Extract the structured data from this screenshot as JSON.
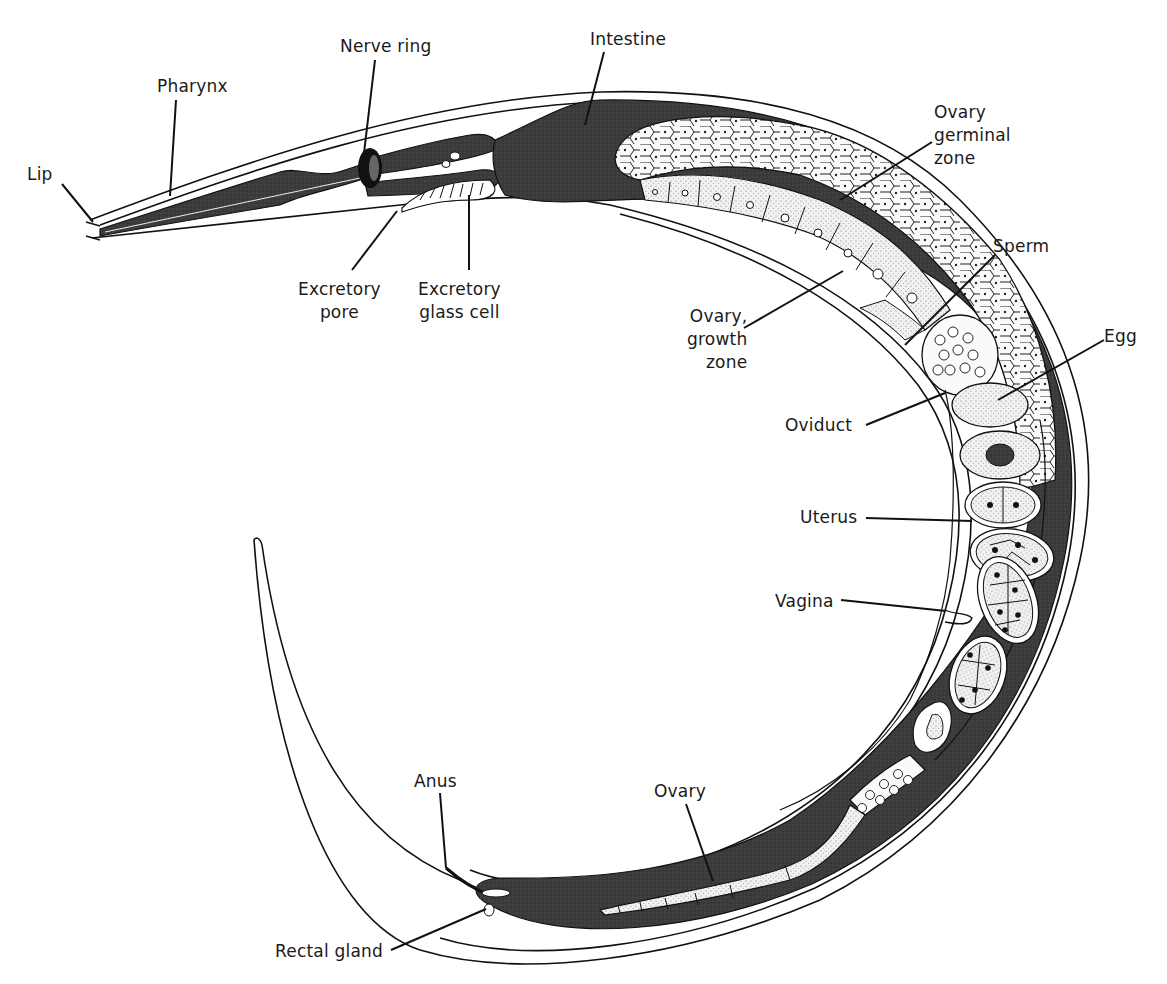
{
  "diagram": {
    "colors": {
      "background": "#ffffff",
      "outline": "#111111",
      "dark_tissue": "#3a3a3a",
      "cell_fill": "#f4f4f4",
      "stipple_fill": "#e6e6e6"
    },
    "labels": [
      {
        "id": "lip",
        "text": "Lip",
        "x": 27,
        "y": 163,
        "align": "left",
        "line": [
          [
            62,
            184
          ],
          [
            93,
            222
          ]
        ]
      },
      {
        "id": "pharynx",
        "text": "Pharynx",
        "x": 157,
        "y": 75,
        "align": "left",
        "line": [
          [
            176,
            100
          ],
          [
            170,
            196
          ]
        ]
      },
      {
        "id": "nerve-ring",
        "text": "Nerve ring",
        "x": 340,
        "y": 35,
        "align": "left",
        "line": [
          [
            375,
            60
          ],
          [
            362,
            170
          ]
        ]
      },
      {
        "id": "intestine",
        "text": "Intestine",
        "x": 590,
        "y": 28,
        "align": "left",
        "line": [
          [
            604,
            52
          ],
          [
            585,
            125
          ]
        ]
      },
      {
        "id": "excretory-pore",
        "text": "Excretory\npore",
        "x": 298,
        "y": 278,
        "align": "center",
        "line": [
          [
            352,
            270
          ],
          [
            397,
            211
          ]
        ]
      },
      {
        "id": "excretory-gland-cell",
        "text": "Excretory\nglass cell",
        "x": 418,
        "y": 278,
        "align": "center",
        "line": [
          [
            469,
            270
          ],
          [
            469,
            195
          ]
        ]
      },
      {
        "id": "ovary-germinal-zone",
        "text": "Ovary\ngerminal\nzone",
        "x": 934,
        "y": 101,
        "align": "left",
        "line": [
          [
            932,
            142
          ],
          [
            840,
            200
          ]
        ]
      },
      {
        "id": "ovary-growth-zone",
        "text": "Ovary,\ngrowth\nzone",
        "x": 687,
        "y": 305,
        "align": "right",
        "line": [
          [
            744,
            328
          ],
          [
            843,
            271
          ]
        ]
      },
      {
        "id": "sperm",
        "text": "Sperm",
        "x": 993,
        "y": 235,
        "align": "left",
        "line": [
          [
            995,
            255
          ],
          [
            905,
            345
          ]
        ]
      },
      {
        "id": "egg",
        "text": "Egg",
        "x": 1104,
        "y": 325,
        "align": "left",
        "line": [
          [
            1104,
            340
          ],
          [
            998,
            400
          ]
        ]
      },
      {
        "id": "oviduct",
        "text": "Oviduct",
        "x": 785,
        "y": 414,
        "align": "left",
        "line": [
          [
            866,
            425
          ],
          [
            945,
            393
          ]
        ]
      },
      {
        "id": "uterus",
        "text": "Uterus",
        "x": 800,
        "y": 506,
        "align": "left",
        "line": [
          [
            866,
            518
          ],
          [
            972,
            521
          ]
        ]
      },
      {
        "id": "vagina",
        "text": "Vagina",
        "x": 775,
        "y": 590,
        "align": "left",
        "line": [
          [
            841,
            600
          ],
          [
            946,
            611
          ]
        ]
      },
      {
        "id": "anus",
        "text": "Anus",
        "x": 414,
        "y": 770,
        "align": "left",
        "line": [
          [
            440,
            793
          ],
          [
            446,
            868
          ]
        ]
      },
      {
        "id": "ovary",
        "text": "Ovary",
        "x": 654,
        "y": 780,
        "align": "left",
        "line": [
          [
            686,
            804
          ],
          [
            713,
            881
          ]
        ]
      },
      {
        "id": "rectal-gland",
        "text": "Rectal gland",
        "x": 275,
        "y": 940,
        "align": "left",
        "line": [
          [
            391,
            950
          ],
          [
            486,
            909
          ]
        ]
      }
    ]
  }
}
